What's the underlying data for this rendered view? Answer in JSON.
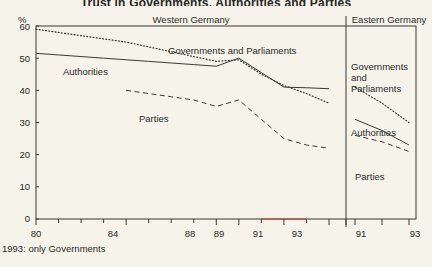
{
  "title": "Trust in Governments, Authorities and Parties",
  "panels": {
    "west_label": "Western Germany",
    "east_label": "Eastern Germany"
  },
  "axis": {
    "unit": "%",
    "y_ticks": [
      "60",
      "50",
      "40",
      "30",
      "20",
      "10",
      "0"
    ],
    "x_ticks_west": [
      "80",
      "84",
      "88",
      "89",
      "91",
      "93"
    ],
    "x_ticks_east": [
      "91",
      "93"
    ]
  },
  "series_labels": {
    "gov_west": "Governments and Parliaments",
    "auth_west": "Authorities",
    "parties_west": "Parties",
    "gov_east_l1": "Governments",
    "gov_east_l2": "and",
    "gov_east_l3": "Parliaments",
    "auth_east": "Authorities",
    "parties_east": "Parties"
  },
  "footnote": "1993: only Governments",
  "colors": {
    "background": "#f5f3ea",
    "ink": "#2b2b26",
    "frame": "#3a3a33",
    "tick_accent": "#c0392b"
  },
  "chart_data": {
    "type": "line",
    "title": "Trust in Governments, Authorities and Parties",
    "xlabel": "",
    "ylabel": "%",
    "ylim": [
      0,
      60
    ],
    "grid": false,
    "legend": "inline-annotations",
    "panels": [
      {
        "name": "Western Germany",
        "x": [
          80,
          81,
          82,
          83,
          84,
          85,
          86,
          87,
          88,
          89,
          90,
          91,
          92,
          93
        ],
        "series": [
          {
            "name": "Governments and Parliaments",
            "style": "dotted",
            "values": [
              59.0,
              58.0,
              57.0,
              56.0,
              55.0,
              53.5,
              52.0,
              50.5,
              49.0,
              49.5,
              45.0,
              41.5,
              39.0,
              36.0
            ]
          },
          {
            "name": "Authorities",
            "style": "solid",
            "values": [
              51.5,
              51.0,
              50.5,
              50.0,
              49.5,
              49.0,
              48.5,
              48.0,
              47.5,
              50.0,
              45.5,
              41.0,
              40.8,
              40.5
            ]
          },
          {
            "name": "Parties",
            "style": "dashed",
            "values": [
              null,
              null,
              null,
              null,
              40.0,
              39.0,
              38.0,
              37.0,
              35.0,
              37.0,
              31.0,
              25.0,
              23.0,
              22.0
            ]
          }
        ]
      },
      {
        "name": "Eastern Germany",
        "x": [
          91,
          92,
          93
        ],
        "series": [
          {
            "name": "Governments and Parliaments",
            "style": "dotted",
            "values": [
              41.0,
              36.0,
              30.0
            ]
          },
          {
            "name": "Authorities",
            "style": "solid",
            "values": [
              31.0,
              27.5,
              23.0
            ]
          },
          {
            "name": "Parties",
            "style": "dashed",
            "values": [
              26.0,
              24.0,
              21.0
            ]
          }
        ]
      }
    ]
  }
}
